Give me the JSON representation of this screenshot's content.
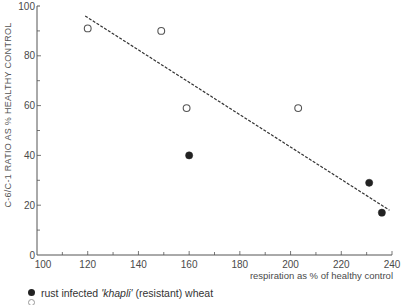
{
  "chart_data": {
    "type": "scatter",
    "title": "",
    "xlabel": "respiration as % of healthy control",
    "ylabel": "C-6/C-1 RATIO AS % HEALTHY CONTROL",
    "xlim": [
      100,
      240
    ],
    "ylim": [
      0,
      100
    ],
    "x_ticks": [
      100,
      120,
      140,
      160,
      180,
      200,
      220,
      240
    ],
    "y_ticks": [
      0,
      20,
      40,
      60,
      80,
      100
    ],
    "minor_tick_step": 10,
    "grid": false,
    "series": [
      {
        "name": "rust infected 'khapli' (resistant) wheat",
        "marker": "filled-circle",
        "points": [
          {
            "x": 160,
            "y": 40
          },
          {
            "x": 231,
            "y": 29
          },
          {
            "x": 236,
            "y": 17
          }
        ]
      },
      {
        "name": "",
        "marker": "open-circle",
        "points": [
          {
            "x": 120,
            "y": 91
          },
          {
            "x": 149,
            "y": 90
          },
          {
            "x": 159,
            "y": 59
          },
          {
            "x": 203,
            "y": 59
          }
        ]
      }
    ],
    "trend_line": {
      "style": "dashed",
      "from": {
        "x": 119,
        "y": 96
      },
      "to": {
        "x": 239,
        "y": 18
      }
    },
    "legend_position": "bottom-left"
  },
  "legend": {
    "entry1_prefix": "rust infected ",
    "entry1_italic": "'khapli'",
    "entry1_suffix": " (resistant) wheat"
  }
}
